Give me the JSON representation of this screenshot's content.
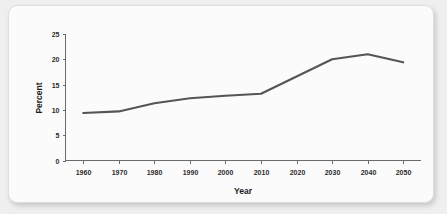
{
  "chart_data": {
    "type": "line",
    "title": "",
    "xlabel": "Year",
    "ylabel": "Percent",
    "x": [
      1960,
      1970,
      1980,
      1990,
      2000,
      2010,
      2020,
      2030,
      2040,
      2050
    ],
    "values": [
      9.4,
      9.7,
      11.3,
      12.3,
      12.8,
      13.2,
      16.6,
      20.0,
      21.0,
      19.4
    ],
    "series": [
      {
        "name": "Percent",
        "values": [
          9.4,
          9.7,
          11.3,
          12.3,
          12.8,
          13.2,
          16.6,
          20.0,
          21.0,
          19.4
        ]
      }
    ],
    "xtick_labels": [
      "1960",
      "1970",
      "1980",
      "1990",
      "2000",
      "2010",
      "2020",
      "2030",
      "2040",
      "2050"
    ],
    "ytick_labels": [
      "0",
      "5",
      "10",
      "15",
      "20",
      "25"
    ],
    "ytick_values": [
      0,
      5,
      10,
      15,
      20,
      25
    ],
    "xlim": [
      1955,
      2055
    ],
    "ylim": [
      0,
      25
    ],
    "grid": false,
    "legend": false,
    "legend_position": "none",
    "line_color": "#555555",
    "axis_color": "#6b6b6b",
    "text_color": "#1c1c1c",
    "background_color": "#fbfbfb"
  }
}
